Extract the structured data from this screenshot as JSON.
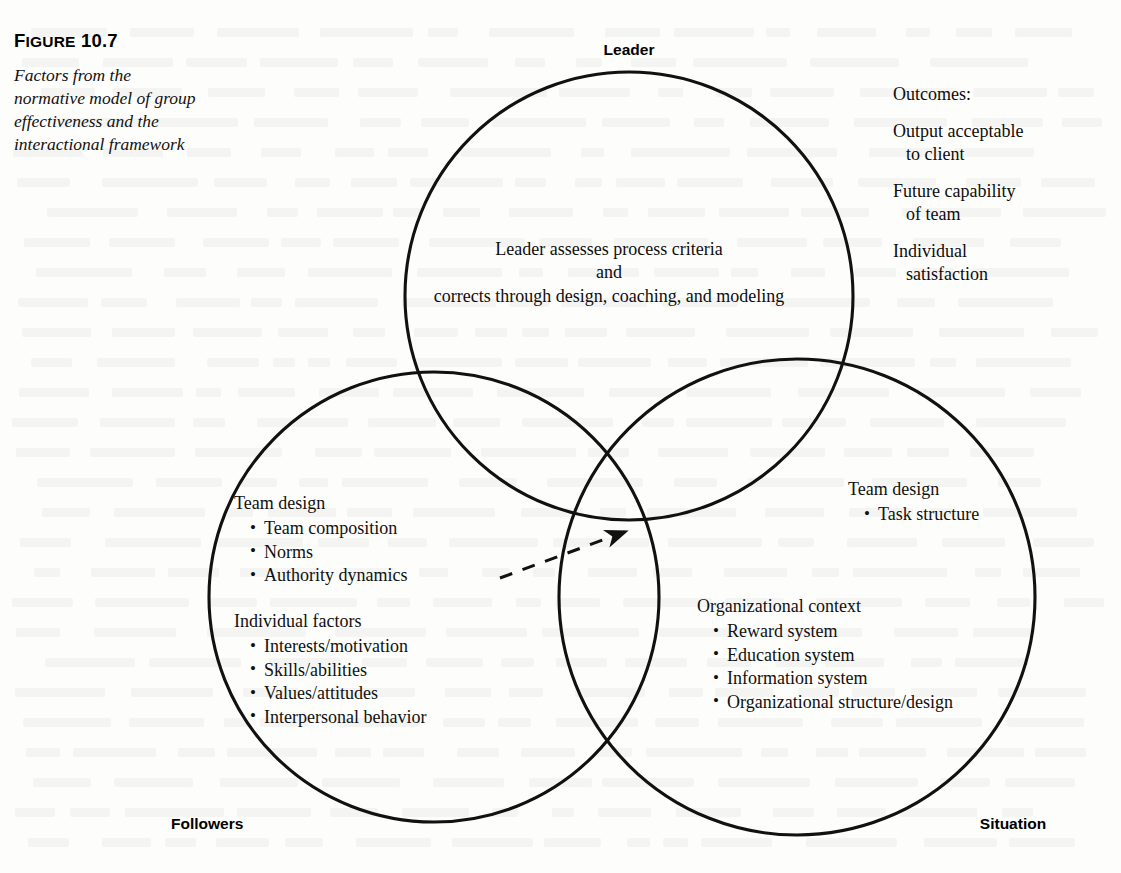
{
  "figure": {
    "number_prefix": "F",
    "number_rest": "IGURE",
    "number_value": "10.7",
    "caption": "Factors from the normative model of group effectiveness and the interactional framework"
  },
  "labels": {
    "leader": "Leader",
    "followers": "Followers",
    "situation": "Situation"
  },
  "leader_circle": {
    "line1": "Leader assesses process criteria",
    "line2": "and",
    "line3": "corrects through design, coaching, and modeling"
  },
  "outcomes": {
    "heading": "Outcomes:",
    "items": [
      {
        "line1": "Output acceptable",
        "line2": "to client"
      },
      {
        "line1": "Future capability",
        "line2": "of team"
      },
      {
        "line1": "Individual",
        "line2": "satisfaction"
      }
    ]
  },
  "followers_circle": {
    "team_design": {
      "heading": "Team design",
      "bullets": [
        "Team composition",
        "Norms",
        "Authority dynamics"
      ]
    },
    "individual_factors": {
      "heading": "Individual factors",
      "bullets": [
        "Interests/motivation",
        "Skills/abilities",
        "Values/attitudes",
        "Interpersonal behavior"
      ]
    }
  },
  "situation_circle": {
    "team_design": {
      "heading": "Team design",
      "bullets": [
        "Task structure"
      ]
    },
    "organizational_context": {
      "heading": "Organizational context",
      "bullets": [
        "Reward system",
        "Education system",
        "Information system",
        "Organizational structure/design"
      ]
    }
  },
  "colors": {
    "stroke": "#111111",
    "text": "#101010",
    "background": "#fdfdfb"
  },
  "geometry": {
    "circle_leader": {
      "cx": 629,
      "cy": 296,
      "r": 224
    },
    "circle_followers": {
      "cx": 434,
      "cy": 597,
      "r": 225
    },
    "circle_situation": {
      "cx": 797,
      "cy": 597,
      "r": 238
    },
    "arrow": {
      "x1": 500,
      "y1": 578,
      "x2": 629,
      "y2": 530
    }
  }
}
